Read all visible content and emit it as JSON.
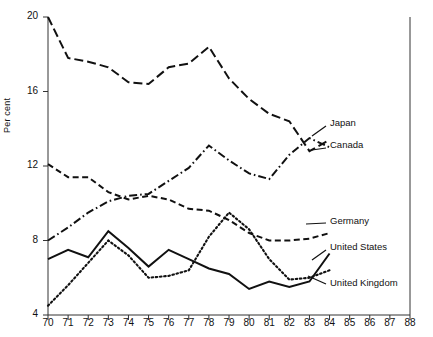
{
  "chart_data": {
    "type": "line",
    "title": "",
    "xlabel": "",
    "ylabel": "Per cent",
    "xlim": [
      70,
      88
    ],
    "ylim": [
      4,
      20
    ],
    "ytick_labels": [
      "4",
      "8",
      "12",
      "16",
      "20"
    ],
    "ytick_values": [
      4,
      8,
      12,
      16,
      20
    ],
    "xtick_labels": [
      "70",
      "71",
      "72",
      "73",
      "74",
      "75",
      "76",
      "77",
      "78",
      "79",
      "80",
      "81",
      "82",
      "83",
      "84",
      "85",
      "86",
      "87",
      "88"
    ],
    "xtick_values": [
      70,
      71,
      72,
      73,
      74,
      75,
      76,
      77,
      78,
      79,
      80,
      81,
      82,
      83,
      84,
      85,
      86,
      87,
      88
    ],
    "grid": false,
    "legend": "right-inline-labels",
    "series": [
      {
        "name": "Japan",
        "style": "long-dash",
        "x": [
          70,
          71,
          72,
          73,
          74,
          75,
          76,
          77,
          78,
          79,
          80,
          81,
          82,
          83,
          84
        ],
        "values": [
          20.0,
          17.8,
          17.6,
          17.3,
          16.5,
          16.4,
          17.3,
          17.5,
          18.4,
          16.7,
          15.6,
          14.8,
          14.4,
          12.8,
          13.4
        ]
      },
      {
        "name": "Canada",
        "style": "dash-dot",
        "x": [
          70,
          71,
          72,
          73,
          74,
          75,
          76,
          77,
          78,
          79,
          80,
          81,
          82,
          83,
          84
        ],
        "values": [
          8.0,
          8.7,
          9.5,
          10.1,
          10.4,
          10.5,
          11.2,
          11.9,
          13.1,
          12.3,
          11.6,
          11.3,
          12.6,
          13.5,
          13.0
        ]
      },
      {
        "name": "Germany",
        "style": "medium-dash",
        "x": [
          70,
          71,
          72,
          73,
          74,
          75,
          76,
          77,
          78,
          79,
          80,
          81,
          82,
          83,
          84
        ],
        "values": [
          12.1,
          11.4,
          11.4,
          10.6,
          10.2,
          10.4,
          10.2,
          9.7,
          9.6,
          9.1,
          8.4,
          8.0,
          8.0,
          8.1,
          8.4
        ]
      },
      {
        "name": "United States",
        "style": "solid",
        "x": [
          70,
          71,
          72,
          73,
          74,
          75,
          76,
          77,
          78,
          79,
          80,
          81,
          82,
          83,
          84
        ],
        "values": [
          7.0,
          7.5,
          7.1,
          8.5,
          7.6,
          6.6,
          7.5,
          7.0,
          6.5,
          6.2,
          5.4,
          5.8,
          5.5,
          5.8,
          7.3
        ]
      },
      {
        "name": "United Kingdom",
        "style": "dotted",
        "x": [
          70,
          71,
          72,
          73,
          74,
          75,
          76,
          77,
          78,
          79,
          80,
          81,
          82,
          83,
          84
        ],
        "values": [
          4.5,
          5.6,
          6.8,
          8.0,
          7.2,
          6.0,
          6.1,
          6.4,
          8.2,
          9.5,
          8.6,
          7.0,
          5.9,
          6.0,
          6.4
        ]
      }
    ]
  }
}
